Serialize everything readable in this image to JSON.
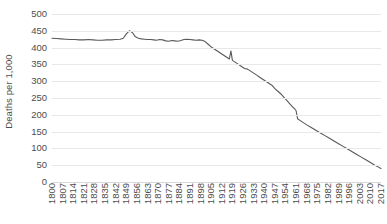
{
  "chart_data": {
    "type": "line",
    "title": "",
    "subtitle": "",
    "xlabel": "",
    "ylabel": "Deaths per 1,000",
    "xlim": [
      1800,
      2017
    ],
    "ylim": [
      0,
      500
    ],
    "grid": true,
    "legend": null,
    "legend_position": "none",
    "y_ticks": [
      500,
      450,
      400,
      350,
      300,
      250,
      200,
      150,
      100,
      50,
      0
    ],
    "x_ticks": [
      1800,
      1807,
      1814,
      1821,
      1828,
      1835,
      1842,
      1849,
      1856,
      1863,
      1870,
      1877,
      1884,
      1891,
      1898,
      1905,
      1912,
      1919,
      1926,
      1933,
      1940,
      1947,
      1954,
      1961,
      1968,
      1975,
      1982,
      1989,
      1996,
      2003,
      2010,
      2017
    ],
    "series": [
      {
        "name": "Deaths per 1,000",
        "color": "#595959",
        "x": [
          1800,
          1803,
          1806,
          1809,
          1812,
          1815,
          1818,
          1821,
          1824,
          1827,
          1830,
          1833,
          1836,
          1839,
          1842,
          1845,
          1847,
          1849,
          1851,
          1853,
          1855,
          1857,
          1859,
          1861,
          1863,
          1865,
          1867,
          1869,
          1871,
          1873,
          1875,
          1877,
          1879,
          1881,
          1883,
          1885,
          1887,
          1889,
          1891,
          1893,
          1895,
          1897,
          1899,
          1901,
          1903,
          1905,
          1907,
          1909,
          1911,
          1913,
          1915,
          1917,
          1918,
          1919,
          1921,
          1923,
          1925,
          1927,
          1929,
          1931,
          1933,
          1935,
          1937,
          1939,
          1941,
          1943,
          1945,
          1947,
          1949,
          1951,
          1953,
          1955,
          1957,
          1959,
          1960,
          1961,
          1962,
          1964,
          1966,
          1968,
          1971,
          1974,
          1977,
          1980,
          1983,
          1986,
          1989,
          1992,
          1995,
          1998,
          2001,
          2004,
          2007,
          2010,
          2013,
          2015,
          2017
        ],
        "y": [
          428,
          427,
          426,
          425,
          424,
          424,
          423,
          423,
          424,
          423,
          422,
          422,
          423,
          423,
          424,
          425,
          428,
          441,
          450,
          445,
          432,
          428,
          426,
          425,
          424,
          424,
          423,
          422,
          424,
          423,
          420,
          419,
          421,
          420,
          419,
          421,
          424,
          425,
          424,
          423,
          422,
          423,
          422,
          418,
          410,
          402,
          396,
          390,
          384,
          378,
          372,
          366,
          390,
          362,
          356,
          350,
          344,
          338,
          336,
          330,
          324,
          318,
          312,
          306,
          300,
          294,
          288,
          278,
          270,
          262,
          252,
          242,
          232,
          222,
          218,
          212,
          188,
          182,
          176,
          170,
          162,
          154,
          146,
          138,
          130,
          122,
          114,
          106,
          98,
          90,
          82,
          74,
          66,
          58,
          50,
          45,
          40
        ]
      }
    ]
  },
  "axes": {
    "y_title": "Deaths per 1,000",
    "y_tick_labels": [
      "500",
      "450",
      "400",
      "350",
      "300",
      "250",
      "200",
      "150",
      "100",
      "50",
      "0"
    ],
    "x_tick_labels": [
      "1800",
      "1807",
      "1814",
      "1821",
      "1828",
      "1835",
      "1842",
      "1849",
      "1856",
      "1863",
      "1870",
      "1877",
      "1884",
      "1891",
      "1898",
      "1905",
      "1912",
      "1919",
      "1926",
      "1933",
      "1940",
      "1947",
      "1954",
      "1961",
      "1968",
      "1975",
      "1982",
      "1989",
      "1996",
      "2003",
      "2010",
      "2017"
    ]
  },
  "colors": {
    "line": "#595959",
    "gridline": "#e8e8e8",
    "text": "#4d4d4d",
    "background": "#ffffff"
  }
}
